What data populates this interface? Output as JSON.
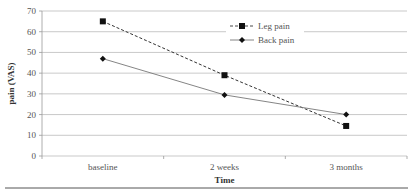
{
  "chart_data": {
    "type": "line",
    "title": "",
    "xlabel": "Time",
    "ylabel": "pain (VAS)",
    "categories": [
      "baseline",
      "2 weeks",
      "3 months"
    ],
    "ylim": [
      0,
      70
    ],
    "yticks": [
      0,
      10,
      20,
      30,
      40,
      50,
      60,
      70
    ],
    "grid": true,
    "legend_position": "upper right (inside)",
    "series": [
      {
        "name": "Leg pain",
        "values": [
          65,
          39,
          14.5
        ],
        "line_style": "dashed",
        "marker": "square"
      },
      {
        "name": "Back pain",
        "values": [
          47,
          29.5,
          20
        ],
        "line_style": "solid",
        "marker": "diamond"
      }
    ]
  }
}
